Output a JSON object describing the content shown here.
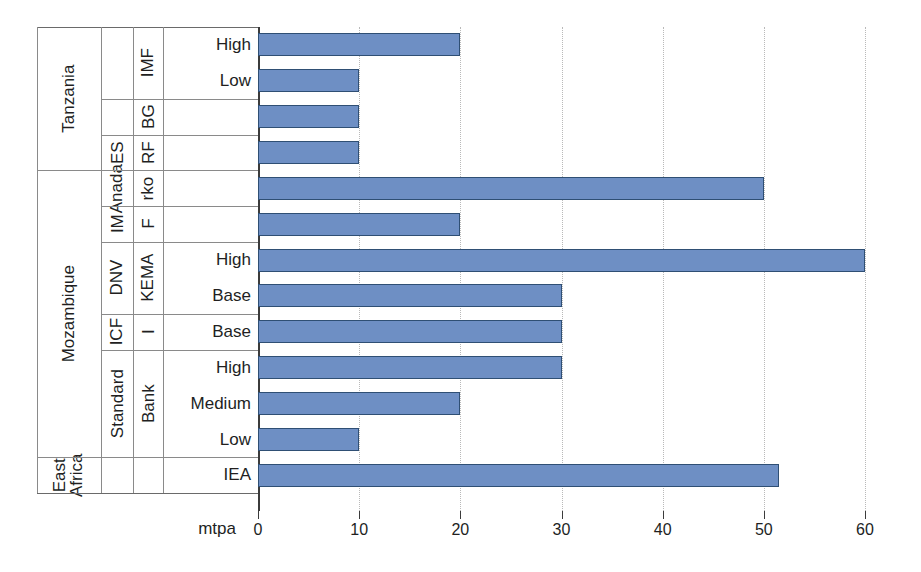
{
  "chart_data": {
    "type": "bar",
    "orientation": "horizontal",
    "title": "",
    "xlabel": "mtpa",
    "ylabel": "",
    "xlim": [
      0,
      60
    ],
    "xticks": [
      0,
      10,
      20,
      30,
      40,
      50,
      60
    ],
    "xtick_labels": [
      "0",
      "10",
      "20",
      "30",
      "40",
      "50",
      "60"
    ],
    "grid": "vertical-dotted",
    "legend": "none",
    "bar_color": "#6e8fc4",
    "bar_edge_color": "#2f4f74",
    "categories": [
      "Tanzania / IMF / High",
      "Tanzania / IMF / Low",
      "Tanzania / BG",
      "Tanzania / RF ES",
      "Mozambique / Anadarko",
      "Mozambique / IMF",
      "Mozambique / DNV KEMA / High",
      "Mozambique / DNV KEMA / Base",
      "Mozambique / ICF I / Base",
      "Mozambique / Standard Bank / High",
      "Mozambique / Standard Bank / Medium",
      "Mozambique / Standard Bank / Low",
      "East Africa / IEA"
    ],
    "values": [
      20,
      10,
      10,
      10,
      50,
      20,
      60,
      30,
      30,
      30,
      20,
      10,
      51.5
    ],
    "rows": [
      {
        "country": "Tanzania",
        "source_line1": "IMF",
        "source_line2": "",
        "scenario": "High",
        "value": 20
      },
      {
        "country": "Tanzania",
        "source_line1": "IMF",
        "source_line2": "",
        "scenario": "Low",
        "value": 10
      },
      {
        "country": "Tanzania",
        "source_line1": "BG",
        "source_line2": "",
        "scenario": "",
        "value": 10
      },
      {
        "country": "Tanzania",
        "source_line1": "RF",
        "source_line2": "ES",
        "scenario": "",
        "value": 10
      },
      {
        "country": "Mozambique",
        "source_line1": "rko",
        "source_line2": "Anada",
        "scenario": "",
        "value": 50
      },
      {
        "country": "Mozambique",
        "source_line1": "F",
        "source_line2": "IM",
        "scenario": "",
        "value": 20
      },
      {
        "country": "Mozambique",
        "source_line1": "KEMA",
        "source_line2": "DNV",
        "scenario": "High",
        "value": 60
      },
      {
        "country": "Mozambique",
        "source_line1": "KEMA",
        "source_line2": "DNV",
        "scenario": "Base",
        "value": 30
      },
      {
        "country": "Mozambique",
        "source_line1": "I",
        "source_line2": "ICF",
        "scenario": "Base",
        "value": 30
      },
      {
        "country": "Mozambique",
        "source_line1": "Bank",
        "source_line2": "Standard",
        "scenario": "High",
        "value": 30
      },
      {
        "country": "Mozambique",
        "source_line1": "Bank",
        "source_line2": "Standard",
        "scenario": "Medium",
        "value": 20
      },
      {
        "country": "Mozambique",
        "source_line1": "Bank",
        "source_line2": "Standard",
        "scenario": "Low",
        "value": 10
      },
      {
        "country": "East Africa",
        "source_line1": "",
        "source_line2": "",
        "scenario": "IEA",
        "value": 51.5
      }
    ]
  },
  "labels": {
    "countries": [
      {
        "name": "Tanzania",
        "text": "Tanzania"
      },
      {
        "name": "Mozambique",
        "text": "Mozambique"
      },
      {
        "name": "East Africa",
        "text": "East\nAfrica"
      }
    ],
    "country_tanzania": "Tanzania",
    "country_mozambique": "Mozambique",
    "country_east_africa_line1": "East",
    "country_east_africa_line2": "Africa",
    "src_imf": "IMF",
    "src_bg": "BG",
    "src_rf": "RF",
    "src_es": "ES",
    "src_anadarko_a": "rko",
    "src_anadarko_b": "Anada",
    "src_imf2_a": "F",
    "src_imf2_b": "IM",
    "src_kema": "KEMA",
    "src_dnv": "DNV",
    "src_icf_i": "I",
    "src_icf": "ICF",
    "src_bank": "Bank",
    "src_standard": "Standard",
    "scn_high": "High",
    "scn_low": "Low",
    "scn_base": "Base",
    "scn_medium": "Medium",
    "scn_iea": "IEA"
  },
  "axis": {
    "unit": "mtpa",
    "t0": "0",
    "t10": "10",
    "t20": "20",
    "t30": "30",
    "t40": "40",
    "t50": "50",
    "t60": "60"
  }
}
